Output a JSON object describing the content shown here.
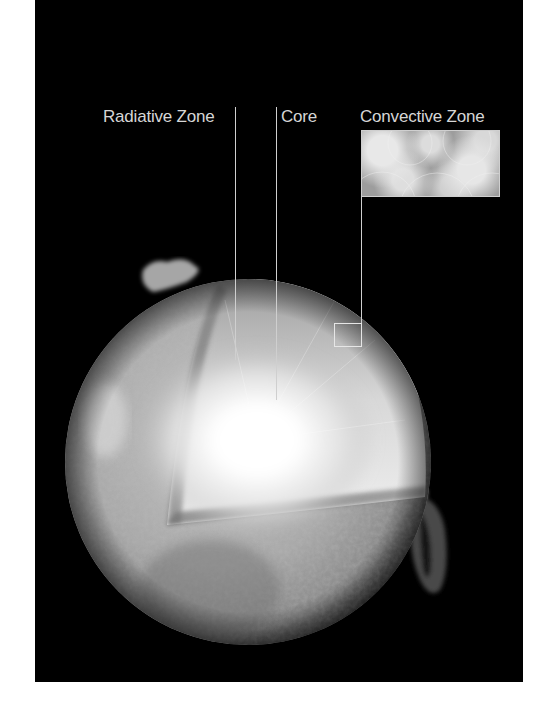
{
  "diagram": {
    "labels": {
      "radiative_zone": "Radiative Zone",
      "core": "Core",
      "convective_zone": "Convective Zone"
    },
    "colors": {
      "background": "#000000",
      "border": "#ffffff",
      "label_text": "#d6d6d6",
      "leader_lines": "#cfcfcf",
      "core_glow": "#ffffff",
      "surface": "#9a9a9a"
    }
  }
}
